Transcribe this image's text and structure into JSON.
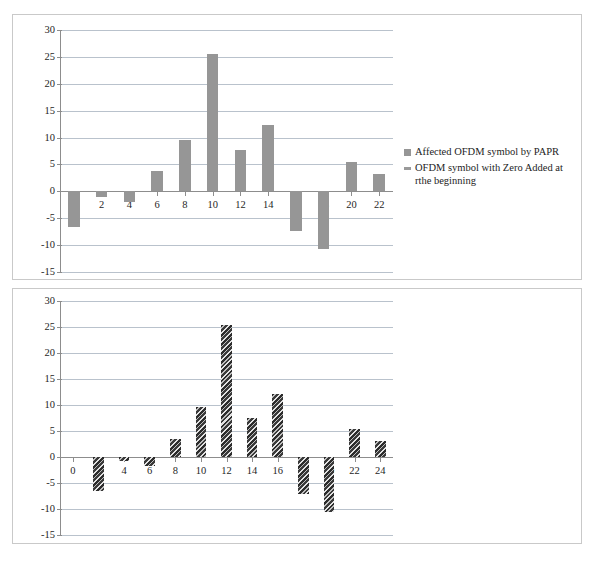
{
  "figure": {
    "caption": ""
  },
  "legend": {
    "position": "right",
    "items": [
      {
        "label": "Affected OFDM symbol by PAPR",
        "style": "solid",
        "color": "#969696"
      },
      {
        "label": "OFDM symbol with Zero Added at rthe beginning",
        "style": "hatch",
        "color": "#9a9a9a"
      }
    ]
  },
  "axis": {
    "y_ticks": [
      "30",
      "25",
      "20",
      "15",
      "10",
      "5",
      "0",
      "-5",
      "-10",
      "-15"
    ]
  },
  "chart_data": [
    {
      "id": "top",
      "type": "bar",
      "title": "",
      "xlabel": "",
      "ylabel": "",
      "ylim": [
        -15,
        30
      ],
      "ytick_values": [
        30,
        25,
        20,
        15,
        10,
        5,
        0,
        -5,
        -10,
        -15
      ],
      "grid": true,
      "legend": "right",
      "series_name": "Affected OFDM symbol by PAPR",
      "bar_style": "solid",
      "bar_color": "#969696",
      "categories": [
        "0",
        "2",
        "4",
        "6",
        "8",
        "10",
        "12",
        "14",
        "16",
        "18",
        "20",
        "22"
      ],
      "values": [
        -6.6,
        -1.0,
        -1.9,
        3.7,
        9.5,
        25.5,
        7.6,
        12.3,
        -7.3,
        -10.7,
        5.5,
        3.2
      ]
    },
    {
      "id": "bottom",
      "type": "bar",
      "title": "",
      "xlabel": "",
      "ylabel": "",
      "ylim": [
        -15,
        30
      ],
      "ytick_values": [
        30,
        25,
        20,
        15,
        10,
        5,
        0,
        -5,
        -10,
        -15
      ],
      "grid": true,
      "legend": "none",
      "series_name": "OFDM symbol with Zero Added at rthe beginning",
      "bar_style": "hatch",
      "bar_color": "#3a3a3a",
      "categories": [
        "0",
        "2",
        "4",
        "6",
        "8",
        "10",
        "12",
        "14",
        "16",
        "18",
        "20",
        "22",
        "24"
      ],
      "values": [
        0.0,
        -6.5,
        -0.8,
        -1.7,
        3.4,
        9.6,
        25.3,
        7.5,
        12.2,
        -7.2,
        -10.6,
        5.4,
        3.1
      ]
    }
  ]
}
